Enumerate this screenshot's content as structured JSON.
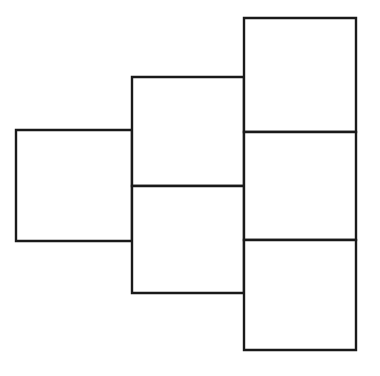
{
  "figure": {
    "title": "",
    "caption": "",
    "type": "geometric-net",
    "canvas": {
      "width": 380,
      "height": 376,
      "background_color": "#ffffff"
    },
    "style": {
      "stroke_color": "#1a1a1a",
      "fill_color": "#ffffff",
      "stroke_width": 2.4
    },
    "square_count": 6,
    "squares": [
      {
        "name": "left-square",
        "label": "",
        "x": 16,
        "y": 130,
        "width": 116,
        "height": 111,
        "column": 1,
        "row": 2
      },
      {
        "name": "middle-upper-square",
        "label": "",
        "x": 132,
        "y": 77,
        "width": 112,
        "height": 109,
        "column": 2,
        "row": 1
      },
      {
        "name": "middle-lower-square",
        "label": "",
        "x": 132,
        "y": 186,
        "width": 112,
        "height": 107,
        "column": 2,
        "row": 2
      },
      {
        "name": "right-top-square",
        "label": "",
        "x": 244,
        "y": 18,
        "width": 112,
        "height": 114,
        "column": 3,
        "row": 1
      },
      {
        "name": "right-middle-square",
        "label": "",
        "x": 244,
        "y": 132,
        "width": 112,
        "height": 108,
        "column": 3,
        "row": 2
      },
      {
        "name": "right-bottom-square",
        "label": "",
        "x": 244,
        "y": 240,
        "width": 112,
        "height": 110,
        "column": 3,
        "row": 3
      }
    ]
  }
}
